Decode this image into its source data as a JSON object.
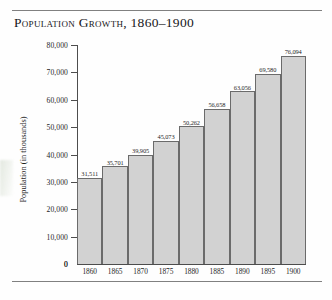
{
  "chart_data": {
    "type": "bar",
    "title": "Population Growth, 1860–1900",
    "xlabel": "",
    "ylabel": "Population (in thousands)",
    "categories": [
      "1860",
      "1865",
      "1870",
      "1875",
      "1880",
      "1885",
      "1890",
      "1895",
      "1900"
    ],
    "values": [
      31511,
      35701,
      39905,
      45073,
      50262,
      56658,
      63056,
      69580,
      76094
    ],
    "value_labels": [
      "31,511",
      "35,701",
      "39,905",
      "45,073",
      "50,262",
      "56,658",
      "63,056",
      "69,580",
      "76,094"
    ],
    "ylim": [
      0,
      80000
    ],
    "ytick_values": [
      0,
      10000,
      20000,
      30000,
      40000,
      50000,
      60000,
      70000,
      80000
    ],
    "ytick_labels": [
      "0",
      "10,000",
      "20,000",
      "30,000",
      "40,000",
      "50,000",
      "60,000",
      "70,000",
      "80,000"
    ],
    "grid": false,
    "legend": null,
    "bar_fill_color": "#d2d2d2",
    "bar_border_color": "#6b6b6b",
    "axis_color": "#4d4d4d",
    "background_color": "#fefefe"
  }
}
